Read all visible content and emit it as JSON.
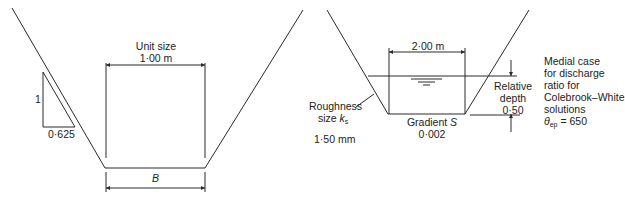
{
  "left_panel": {
    "unit_size_label": "Unit size",
    "unit_size_value": "1·00 m",
    "slope_vertical": "1",
    "slope_horizontal": "0·625",
    "bed_width_symbol": "B"
  },
  "right_panel": {
    "top_width": "2·00 m",
    "roughness_label_1": "Roughness",
    "roughness_label_2": "size ",
    "roughness_symbol": "k",
    "roughness_subscript": "s",
    "roughness_value": "1·50 mm",
    "gradient_label": "Gradient ",
    "gradient_symbol": "S",
    "gradient_value": "0·002",
    "relative_depth_label_1": "Relative",
    "relative_depth_label_2": "depth",
    "relative_depth_value": "0·50",
    "note_lines": [
      "Medial case",
      "for discharge",
      "ratio for",
      "Colebrook–White",
      "solutions"
    ],
    "theta_symbol": "θ",
    "theta_subscript": "ep",
    "theta_value": " = 650"
  },
  "colors": {
    "line": "#2a2a2a",
    "background": "#ffffff"
  }
}
